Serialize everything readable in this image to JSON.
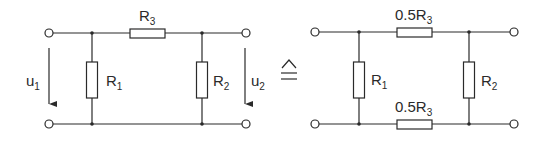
{
  "diagram": {
    "type": "circuit",
    "equivalence_symbol": "≙",
    "left_circuit": {
      "resistors": [
        {
          "id": "R3",
          "label": "R",
          "subscript": "3",
          "position": "series-top"
        },
        {
          "id": "R1",
          "label": "R",
          "subscript": "1",
          "position": "shunt-left"
        },
        {
          "id": "R2",
          "label": "R",
          "subscript": "2",
          "position": "shunt-right"
        }
      ],
      "voltages": [
        {
          "id": "u1",
          "label": "u",
          "subscript": "1",
          "side": "input"
        },
        {
          "id": "u2",
          "label": "u",
          "subscript": "2",
          "side": "output"
        }
      ]
    },
    "right_circuit": {
      "resistors": [
        {
          "id": "R3a",
          "label": "0.5R",
          "subscript": "3",
          "position": "series-top"
        },
        {
          "id": "R1",
          "label": "R",
          "subscript": "1",
          "position": "shunt-left"
        },
        {
          "id": "R2",
          "label": "R",
          "subscript": "2",
          "position": "shunt-right"
        },
        {
          "id": "R3b",
          "label": "0.5R",
          "subscript": "3",
          "position": "series-bottom"
        }
      ]
    }
  }
}
